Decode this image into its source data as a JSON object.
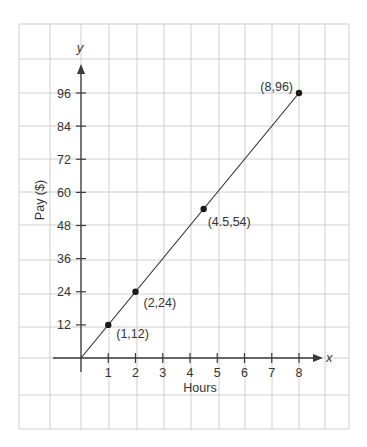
{
  "chart_data": {
    "type": "line",
    "title": "",
    "xlabel": "Hours",
    "ylabel": "Pay ($)",
    "x_axis_variable": "x",
    "y_axis_variable": "y",
    "x_ticks": [
      1,
      2,
      3,
      4,
      5,
      6,
      7,
      8
    ],
    "y_ticks": [
      12,
      24,
      36,
      48,
      60,
      72,
      84,
      96
    ],
    "xlim": [
      0,
      8
    ],
    "ylim": [
      0,
      96
    ],
    "grid": true,
    "series": [
      {
        "name": "Pay",
        "x": [
          0,
          8
        ],
        "y": [
          0,
          96
        ]
      }
    ],
    "points": [
      {
        "x": 1,
        "y": 12,
        "label": "(1,12)"
      },
      {
        "x": 2,
        "y": 24,
        "label": "(2,24)"
      },
      {
        "x": 4.5,
        "y": 54,
        "label": "(4.5,54)"
      },
      {
        "x": 8,
        "y": 96,
        "label": "(8,96)"
      }
    ]
  },
  "colors": {
    "grid": "#cfcfcf",
    "axis": "#3a3a3a",
    "line": "#2a2a2a",
    "point": "#1a1a1a",
    "text": "#333333"
  }
}
